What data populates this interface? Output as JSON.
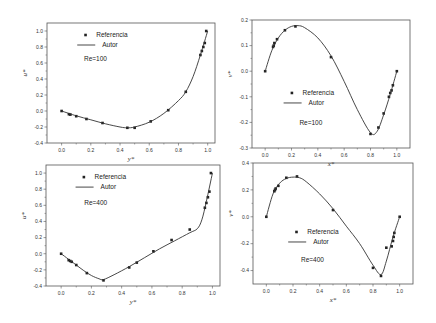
{
  "figure": {
    "panel_count": 4
  },
  "chart_data": [
    {
      "type": "line",
      "panel": "top-left",
      "title": "",
      "xlabel": "y*",
      "ylabel": "u*",
      "xlim": [
        -0.1,
        1.05
      ],
      "ylim": [
        -0.4,
        1.1
      ],
      "xticks": [
        "0.0",
        "0.2",
        "0.4",
        "0.6",
        "0.8",
        "1.0"
      ],
      "yticks": [
        "-0.4",
        "-0.2",
        "0.0",
        "0.2",
        "0.4",
        "0.6",
        "0.8",
        "1.0"
      ],
      "annotation": "Re=100",
      "legend": {
        "position": "upper-left",
        "entries": [
          "Referencia",
          "Autor"
        ]
      },
      "series": [
        {
          "name": "Referencia",
          "style": "markers",
          "x": [
            0.0,
            0.05,
            0.06,
            0.1,
            0.17,
            0.28,
            0.45,
            0.5,
            0.61,
            0.73,
            0.85,
            0.95,
            0.96,
            0.97,
            0.98,
            0.99
          ],
          "y": [
            0.0,
            -0.04,
            -0.045,
            -0.065,
            -0.1,
            -0.15,
            -0.21,
            -0.21,
            -0.13,
            0.01,
            0.24,
            0.7,
            0.75,
            0.8,
            0.85,
            1.0
          ]
        },
        {
          "name": "Autor",
          "style": "line",
          "x": [
            0.0,
            0.1,
            0.2,
            0.3,
            0.4,
            0.45,
            0.5,
            0.6,
            0.7,
            0.8,
            0.85,
            0.9,
            0.95,
            1.0
          ],
          "y": [
            0.0,
            -0.06,
            -0.11,
            -0.16,
            -0.2,
            -0.21,
            -0.2,
            -0.14,
            -0.03,
            0.13,
            0.24,
            0.43,
            0.7,
            1.0
          ]
        }
      ]
    },
    {
      "type": "line",
      "panel": "top-right",
      "title": "",
      "xlabel": "x*",
      "ylabel": "v*",
      "xlim": [
        -0.1,
        1.1
      ],
      "ylim": [
        -0.3,
        0.2
      ],
      "xticks": [
        "0.0",
        "0.2",
        "0.4",
        "0.6",
        "0.8",
        "1.0"
      ],
      "yticks": [
        "-0.3",
        "-0.2",
        "-0.1",
        "0.0",
        "0.1",
        "0.2"
      ],
      "annotation": "Re=100",
      "legend": {
        "position": "center-left",
        "entries": [
          "Referencia",
          "Autor"
        ]
      },
      "series": [
        {
          "name": "Referencia",
          "style": "markers",
          "x": [
            0.0,
            0.06,
            0.065,
            0.07,
            0.09,
            0.15,
            0.23,
            0.5,
            0.8,
            0.86,
            0.9,
            0.94,
            0.95,
            0.96,
            0.97,
            1.0
          ],
          "y": [
            0.0,
            0.095,
            0.1,
            0.11,
            0.125,
            0.16,
            0.175,
            0.055,
            -0.245,
            -0.22,
            -0.165,
            -0.1,
            -0.085,
            -0.075,
            -0.055,
            0.0
          ]
        },
        {
          "name": "Autor",
          "style": "line",
          "x": [
            0.0,
            0.05,
            0.1,
            0.15,
            0.2,
            0.25,
            0.3,
            0.4,
            0.5,
            0.6,
            0.7,
            0.8,
            0.85,
            0.9,
            0.95,
            1.0
          ],
          "y": [
            0.0,
            0.08,
            0.13,
            0.16,
            0.175,
            0.178,
            0.17,
            0.13,
            0.06,
            -0.04,
            -0.15,
            -0.24,
            -0.235,
            -0.17,
            -0.09,
            0.0
          ]
        }
      ]
    },
    {
      "type": "line",
      "panel": "bottom-left",
      "title": "",
      "xlabel": "y*",
      "ylabel": "u*",
      "xlim": [
        -0.1,
        1.05
      ],
      "ylim": [
        -0.4,
        1.1
      ],
      "xticks": [
        "0.0",
        "0.2",
        "0.4",
        "0.6",
        "0.8",
        "1.0"
      ],
      "yticks": [
        "-0.4",
        "-0.2",
        "0.0",
        "0.2",
        "0.4",
        "0.6",
        "0.8",
        "1.0"
      ],
      "annotation": "Re=400",
      "legend": {
        "position": "upper-left",
        "entries": [
          "Referencia",
          "Autor"
        ]
      },
      "series": [
        {
          "name": "Referencia",
          "style": "markers",
          "x": [
            0.0,
            0.05,
            0.06,
            0.07,
            0.1,
            0.17,
            0.28,
            0.45,
            0.5,
            0.61,
            0.73,
            0.85,
            0.95,
            0.96,
            0.97,
            0.98,
            0.99
          ],
          "y": [
            0.0,
            -0.08,
            -0.09,
            -0.1,
            -0.14,
            -0.24,
            -0.33,
            -0.17,
            -0.11,
            0.03,
            0.17,
            0.3,
            0.57,
            0.63,
            0.7,
            0.77,
            1.0
          ]
        },
        {
          "name": "Autor",
          "style": "line",
          "x": [
            0.0,
            0.05,
            0.1,
            0.15,
            0.2,
            0.25,
            0.28,
            0.35,
            0.45,
            0.55,
            0.65,
            0.75,
            0.85,
            0.9,
            0.93,
            0.96,
            1.0
          ],
          "y": [
            0.0,
            -0.07,
            -0.14,
            -0.21,
            -0.27,
            -0.31,
            -0.32,
            -0.26,
            -0.16,
            -0.05,
            0.06,
            0.16,
            0.26,
            0.31,
            0.42,
            0.65,
            1.0
          ]
        }
      ]
    },
    {
      "type": "line",
      "panel": "bottom-right",
      "title": "",
      "xlabel": "x*",
      "ylabel": "v*",
      "xlim": [
        -0.1,
        1.1
      ],
      "ylim": [
        -0.5,
        0.4
      ],
      "xticks": [
        "0.0",
        "0.2",
        "0.4",
        "0.6",
        "0.8",
        "1.0"
      ],
      "yticks": [
        "-0.4",
        "-0.2",
        "0.0",
        "0.2",
        "0.4"
      ],
      "annotation": "Re=400",
      "legend": {
        "position": "center-left",
        "entries": [
          "Referencia",
          "Autor"
        ]
      },
      "series": [
        {
          "name": "Referencia",
          "style": "markers",
          "x": [
            0.0,
            0.06,
            0.065,
            0.07,
            0.09,
            0.15,
            0.23,
            0.5,
            0.8,
            0.86,
            0.9,
            0.94,
            0.95,
            0.955,
            0.96,
            1.0
          ],
          "y": [
            0.0,
            0.19,
            0.2,
            0.21,
            0.23,
            0.29,
            0.3,
            0.05,
            -0.38,
            -0.44,
            -0.23,
            -0.22,
            -0.18,
            -0.15,
            -0.12,
            0.0
          ]
        },
        {
          "name": "Autor",
          "style": "line",
          "x": [
            0.0,
            0.05,
            0.1,
            0.15,
            0.2,
            0.25,
            0.3,
            0.4,
            0.5,
            0.6,
            0.7,
            0.8,
            0.86,
            0.9,
            0.95,
            1.0
          ],
          "y": [
            0.0,
            0.17,
            0.25,
            0.285,
            0.295,
            0.29,
            0.26,
            0.17,
            0.06,
            -0.07,
            -0.2,
            -0.36,
            -0.43,
            -0.33,
            -0.15,
            0.0
          ]
        }
      ]
    }
  ]
}
